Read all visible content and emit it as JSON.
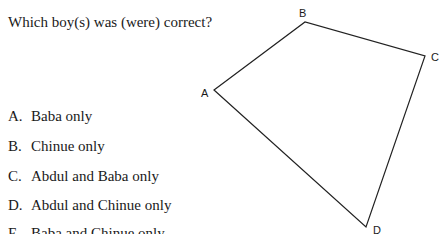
{
  "question": "Which boy(s) was (were) correct?",
  "options": [
    {
      "letter": "A.",
      "text": "Baba only"
    },
    {
      "letter": "B.",
      "text": "Chinue only"
    },
    {
      "letter": "C.",
      "text": "Abdul and Baba only"
    },
    {
      "letter": "D.",
      "text": "Abdul and Chinue only"
    },
    {
      "letter": "E.",
      "text": "Baba and Chinue only"
    }
  ],
  "figure": {
    "vertex_labels": {
      "A": "A",
      "B": "B",
      "C": "C",
      "D": "D"
    }
  }
}
